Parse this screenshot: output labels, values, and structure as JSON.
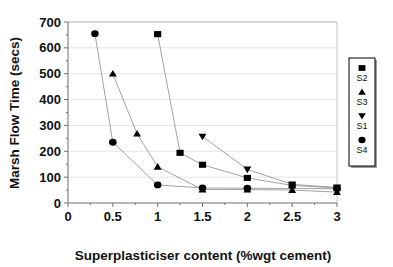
{
  "chart_data": {
    "type": "line",
    "title": "",
    "subtitle": "",
    "xlabel": "Superplasticiser content (%wgt cement)",
    "ylabel": "Marsh Flow Time (secs)",
    "xlim": [
      0,
      3
    ],
    "ylim": [
      0,
      700
    ],
    "xticks": [
      "0",
      "0.5",
      "1",
      "1.5",
      "2",
      "2.5",
      "3"
    ],
    "xtick_values": [
      0,
      0.5,
      1,
      1.5,
      2,
      2.5,
      3
    ],
    "yticks": [
      "0",
      "100",
      "200",
      "300",
      "400",
      "500",
      "600",
      "700"
    ],
    "ytick_values": [
      0,
      100,
      200,
      300,
      400,
      500,
      600,
      700
    ],
    "grid": "horizontal",
    "legend_position": "right-outside",
    "series": [
      {
        "name": "S2",
        "marker": "square",
        "points": [
          {
            "x": 1.0,
            "y": 653
          },
          {
            "x": 1.25,
            "y": 194
          },
          {
            "x": 1.5,
            "y": 148
          },
          {
            "x": 2.0,
            "y": 97
          },
          {
            "x": 2.5,
            "y": 68
          },
          {
            "x": 3.0,
            "y": 58
          }
        ]
      },
      {
        "name": "S3",
        "marker": "triangle-up",
        "points": [
          {
            "x": 0.5,
            "y": 500
          },
          {
            "x": 0.77,
            "y": 268
          },
          {
            "x": 1.0,
            "y": 140
          },
          {
            "x": 1.5,
            "y": 52
          },
          {
            "x": 2.0,
            "y": 52
          },
          {
            "x": 2.5,
            "y": 50
          },
          {
            "x": 3.0,
            "y": 42
          }
        ]
      },
      {
        "name": "S1",
        "marker": "triangle-down",
        "points": [
          {
            "x": 1.5,
            "y": 257
          },
          {
            "x": 2.0,
            "y": 130
          },
          {
            "x": 2.5,
            "y": 72
          },
          {
            "x": 3.0,
            "y": 60
          }
        ]
      },
      {
        "name": "S4",
        "marker": "circle",
        "points": [
          {
            "x": 0.3,
            "y": 655
          },
          {
            "x": 0.5,
            "y": 235
          },
          {
            "x": 1.0,
            "y": 70
          },
          {
            "x": 1.5,
            "y": 58
          },
          {
            "x": 2.0,
            "y": 57
          },
          {
            "x": 3.0,
            "y": 55
          }
        ]
      }
    ],
    "legend": [
      {
        "label": "S2",
        "marker": "square"
      },
      {
        "label": "S3",
        "marker": "triangle-up"
      },
      {
        "label": "S1",
        "marker": "triangle-down"
      },
      {
        "label": "S4",
        "marker": "circle"
      }
    ],
    "colors": {
      "marker": "#000000",
      "line": "#8a8a8a",
      "grid": "#d8d8d8",
      "axis": "#6e6e6e",
      "background": "#ffffff"
    }
  }
}
